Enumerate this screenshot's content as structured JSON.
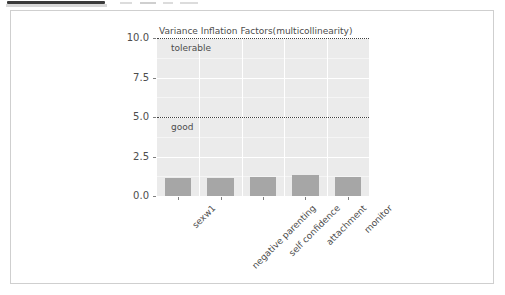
{
  "window": {
    "chrome_fragments": 4
  },
  "chart_data": {
    "type": "bar",
    "title": "Variance Inflation Factors(multicollinearity)",
    "xlabel": "",
    "ylabel": "",
    "categories": [
      "sexw1",
      "negative parenting",
      "self confidence",
      "attachment",
      "monitor"
    ],
    "values": [
      1.15,
      1.12,
      1.18,
      1.3,
      1.2
    ],
    "ylim": [
      0,
      10
    ],
    "yticks": [
      "0.0",
      "2.5",
      "5.0",
      "7.5",
      "10.0"
    ],
    "ytick_values": [
      0,
      2.5,
      5,
      7.5,
      10
    ],
    "grid": true,
    "legend": "none",
    "bar_color": "#a6a6a6",
    "panel_color": "#ebebeb",
    "gridline_color": "#ffffff",
    "annotations": [
      {
        "label": "tolerable",
        "y": 10,
        "line_style": "dotted",
        "line_color": "#404040"
      },
      {
        "label": "good",
        "y": 5,
        "line_style": "dotted",
        "line_color": "#404040"
      }
    ]
  }
}
